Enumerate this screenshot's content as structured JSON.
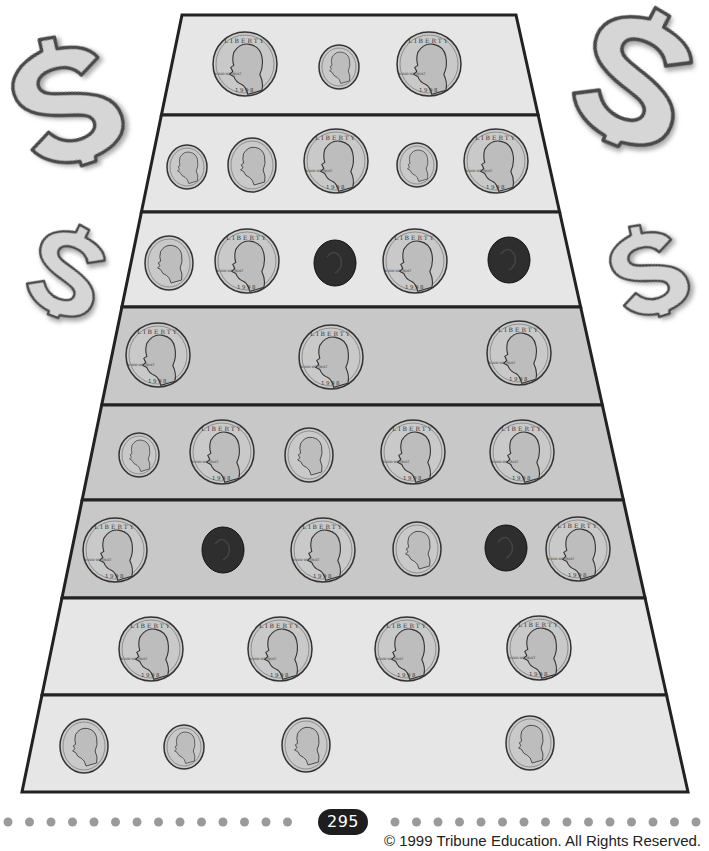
{
  "page": {
    "page_number": "295",
    "copyright": "© 1999 Tribune Education. All Rights Reserved."
  },
  "colors": {
    "light_row": "#e6e6e6",
    "dark_row": "#c8c8c8",
    "outline": "#222222",
    "coin_silver": "#c9c9c9",
    "penny": "#2e2e2e",
    "dollar_fill": "#d4d4d4",
    "dots": "#9a9a9a"
  },
  "coin_labels": {
    "quarter_top": "LIBERTY",
    "quarter_motto": "IN GOD WE TRUST",
    "quarter_year": "1998"
  },
  "decorations": [
    {
      "name": "dollar-sign-top-left",
      "x": 0,
      "y": 30,
      "w": 130,
      "h": 140,
      "rot": -18
    },
    {
      "name": "dollar-sign-top-right",
      "x": 565,
      "y": 0,
      "w": 140,
      "h": 150,
      "rot": 22
    },
    {
      "name": "dollar-sign-mid-left",
      "x": 25,
      "y": 220,
      "w": 85,
      "h": 100,
      "rot": 20
    },
    {
      "name": "dollar-sign-mid-right",
      "x": 605,
      "y": 220,
      "w": 85,
      "h": 100,
      "rot": -18
    }
  ],
  "trapezoid": {
    "top_y": 15,
    "bottom_y": 792,
    "top_left_x": 182,
    "top_right_x": 516,
    "bottom_left_x": 22,
    "bottom_right_x": 688
  },
  "rows": [
    {
      "y0": 15,
      "y1": 115,
      "shade": "light",
      "coins": [
        {
          "type": "quarter",
          "x": 245,
          "y": 64
        },
        {
          "type": "dime",
          "x": 339,
          "y": 67
        },
        {
          "type": "quarter",
          "x": 429,
          "y": 64
        }
      ]
    },
    {
      "y0": 115,
      "y1": 212,
      "shade": "light",
      "coins": [
        {
          "type": "dime",
          "x": 187,
          "y": 167
        },
        {
          "type": "nickel",
          "x": 252,
          "y": 165
        },
        {
          "type": "quarter",
          "x": 336,
          "y": 161
        },
        {
          "type": "dime",
          "x": 417,
          "y": 165
        },
        {
          "type": "quarter",
          "x": 496,
          "y": 161
        }
      ]
    },
    {
      "y0": 212,
      "y1": 307,
      "shade": "light",
      "coins": [
        {
          "type": "nickel",
          "x": 169,
          "y": 263
        },
        {
          "type": "quarter",
          "x": 247,
          "y": 261
        },
        {
          "type": "penny",
          "x": 335,
          "y": 263
        },
        {
          "type": "quarter",
          "x": 415,
          "y": 261
        },
        {
          "type": "penny",
          "x": 509,
          "y": 260
        }
      ]
    },
    {
      "y0": 307,
      "y1": 405,
      "shade": "dark",
      "coins": [
        {
          "type": "quarter",
          "x": 158,
          "y": 355
        },
        {
          "type": "quarter",
          "x": 331,
          "y": 357
        },
        {
          "type": "quarter",
          "x": 519,
          "y": 353
        }
      ]
    },
    {
      "y0": 405,
      "y1": 500,
      "shade": "dark",
      "coins": [
        {
          "type": "dime",
          "x": 139,
          "y": 455
        },
        {
          "type": "quarter",
          "x": 222,
          "y": 452
        },
        {
          "type": "nickel",
          "x": 309,
          "y": 455
        },
        {
          "type": "quarter",
          "x": 413,
          "y": 452
        },
        {
          "type": "quarter",
          "x": 522,
          "y": 452
        }
      ]
    },
    {
      "y0": 500,
      "y1": 598,
      "shade": "dark",
      "coins": [
        {
          "type": "quarter",
          "x": 115,
          "y": 550
        },
        {
          "type": "penny",
          "x": 223,
          "y": 550
        },
        {
          "type": "quarter",
          "x": 323,
          "y": 550
        },
        {
          "type": "nickel",
          "x": 417,
          "y": 549
        },
        {
          "type": "penny",
          "x": 506,
          "y": 548
        },
        {
          "type": "quarter",
          "x": 578,
          "y": 549
        }
      ]
    },
    {
      "y0": 598,
      "y1": 695,
      "shade": "light",
      "coins": [
        {
          "type": "quarter",
          "x": 151,
          "y": 649
        },
        {
          "type": "quarter",
          "x": 280,
          "y": 649
        },
        {
          "type": "quarter",
          "x": 407,
          "y": 649
        },
        {
          "type": "quarter",
          "x": 539,
          "y": 648
        }
      ]
    },
    {
      "y0": 695,
      "y1": 792,
      "shade": "light",
      "coins": [
        {
          "type": "nickel",
          "x": 84,
          "y": 746
        },
        {
          "type": "dime",
          "x": 184,
          "y": 747
        },
        {
          "type": "nickel",
          "x": 306,
          "y": 745
        },
        {
          "type": "nickel",
          "x": 530,
          "y": 743
        }
      ]
    }
  ],
  "coin_specs": {
    "quarter": {
      "rx": 32,
      "ry": 32
    },
    "nickel": {
      "rx": 24,
      "ry": 27
    },
    "dime": {
      "rx": 20,
      "ry": 22
    },
    "penny": {
      "rx": 21,
      "ry": 23
    }
  }
}
